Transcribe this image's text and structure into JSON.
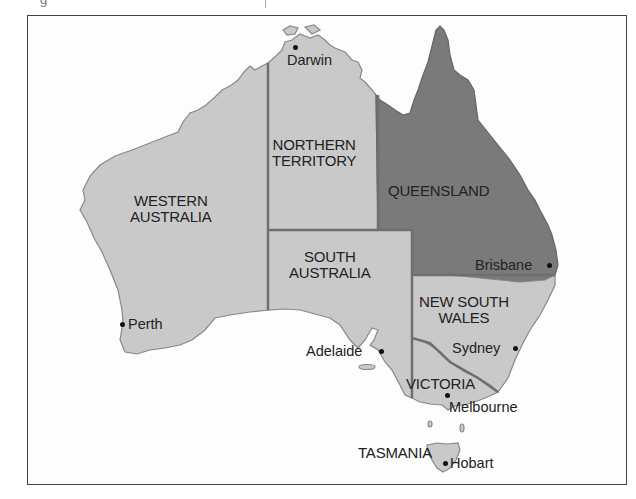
{
  "map": {
    "title": "Australia states and capitals",
    "colors": {
      "state_fill": "#c9c9c9",
      "highlight_fill": "#7a7a7a",
      "border": "#6f6f6f",
      "background": "#fdfdfd",
      "text": "#222222"
    },
    "highlighted_state": "QUEENSLAND",
    "states": [
      {
        "id": "wa",
        "line1": "WESTERN",
        "line2": "AUSTRALIA"
      },
      {
        "id": "nt",
        "line1": "NORTHERN",
        "line2": "TERRITORY"
      },
      {
        "id": "qld",
        "line1": "QUEENSLAND"
      },
      {
        "id": "sa",
        "line1": "SOUTH",
        "line2": "AUSTRALIA"
      },
      {
        "id": "nsw",
        "line1": "NEW SOUTH",
        "line2": "WALES"
      },
      {
        "id": "vic",
        "line1": "VICTORIA"
      },
      {
        "id": "tas",
        "line1": "TASMANIA"
      }
    ],
    "cities": [
      {
        "name": "Darwin"
      },
      {
        "name": "Perth"
      },
      {
        "name": "Adelaide"
      },
      {
        "name": "Brisbane"
      },
      {
        "name": "Sydney"
      },
      {
        "name": "Melbourne"
      },
      {
        "name": "Hobart"
      }
    ]
  }
}
